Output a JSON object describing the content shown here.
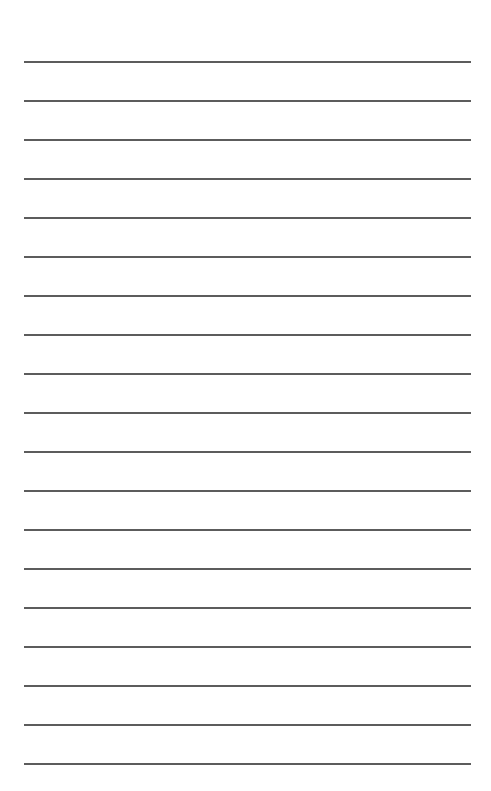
{
  "page": {
    "type": "lined-paper",
    "background_color": "#ffffff",
    "line_color": "#4a4a4a",
    "line_count": 19,
    "line_left_px": 24,
    "line_right_px": 471,
    "first_line_y_px": 62,
    "line_spacing_px": 39
  }
}
